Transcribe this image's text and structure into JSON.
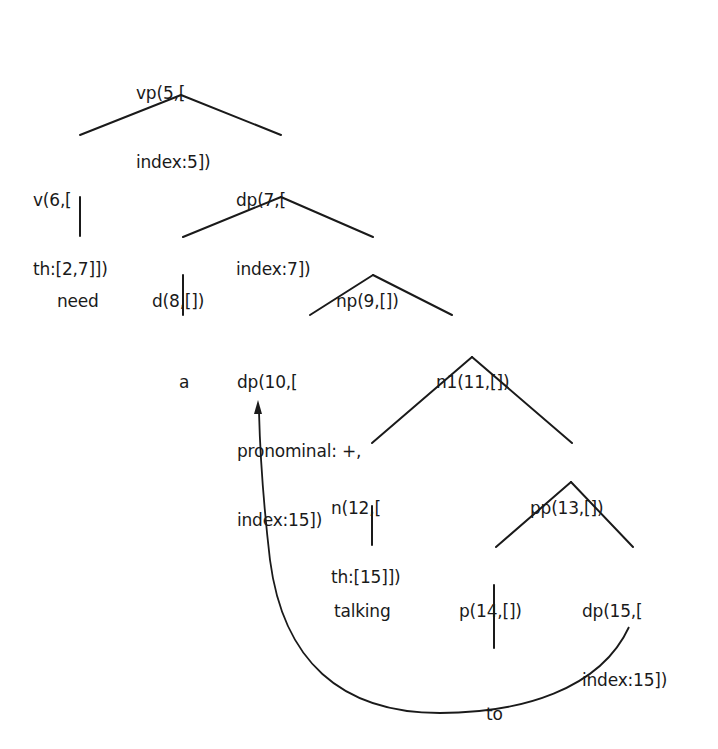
{
  "diagram": {
    "type": "syntax-tree",
    "nodes": {
      "vp5": {
        "lines": [
          "vp(5,[",
          "index:5])"
        ]
      },
      "v6": {
        "lines": [
          "v(6,[",
          "th:[2,7]])"
        ]
      },
      "dp7": {
        "lines": [
          "dp(7,[",
          "index:7])"
        ]
      },
      "need": {
        "lines": [
          "need"
        ]
      },
      "d8": {
        "lines": [
          "d(8,[])"
        ]
      },
      "np9": {
        "lines": [
          "np(9,[])"
        ]
      },
      "a": {
        "lines": [
          "a"
        ]
      },
      "dp10": {
        "lines": [
          "dp(10,[",
          "pronominal: +,",
          "index:15])"
        ]
      },
      "n1_11": {
        "lines": [
          "n1(11,[])"
        ]
      },
      "n12": {
        "lines": [
          "n(12,[",
          "th:[15]])"
        ]
      },
      "pp13": {
        "lines": [
          "pp(13,[])"
        ]
      },
      "talking": {
        "lines": [
          "talking"
        ]
      },
      "p14": {
        "lines": [
          "p(14,[])"
        ]
      },
      "dp15": {
        "lines": [
          "dp(15,[",
          "index:15])"
        ]
      },
      "to": {
        "lines": [
          "to"
        ]
      }
    },
    "edges": [
      [
        "vp5",
        "v6"
      ],
      [
        "vp5",
        "dp7"
      ],
      [
        "v6",
        "need"
      ],
      [
        "dp7",
        "d8"
      ],
      [
        "dp7",
        "np9"
      ],
      [
        "d8",
        "a"
      ],
      [
        "np9",
        "dp10"
      ],
      [
        "np9",
        "n1_11"
      ],
      [
        "n1_11",
        "n12"
      ],
      [
        "n1_11",
        "pp13"
      ],
      [
        "n12",
        "talking"
      ],
      [
        "pp13",
        "p14"
      ],
      [
        "pp13",
        "dp15"
      ],
      [
        "p14",
        "to"
      ]
    ],
    "coreference_arrow": {
      "from": "dp15",
      "to": "dp10",
      "label": "index:15"
    }
  }
}
